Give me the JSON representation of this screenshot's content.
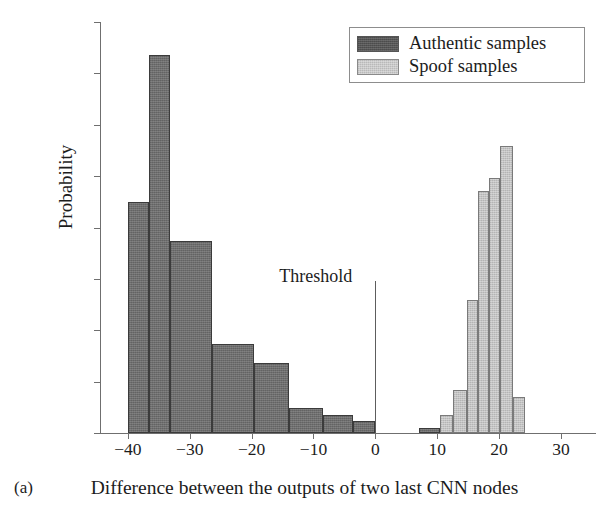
{
  "panel": {
    "tag": "(a)"
  },
  "axes": {
    "ylabel": "Probability",
    "xlabel": "Difference between the outputs of two last CNN nodes",
    "ytick_labels": [
      "0",
      "0.05",
      "0.1",
      "0.15",
      "0.2",
      "0.25",
      "0.3",
      "0.35",
      "0.4"
    ],
    "xtick_labels": [
      "−40",
      "−30",
      "−20",
      "−10",
      "0",
      "10",
      "20",
      "30"
    ]
  },
  "legend": {
    "position": "top-right",
    "entries": [
      {
        "label": "Authentic samples",
        "color": "#555555",
        "key": "authentic"
      },
      {
        "label": "Spoof samples",
        "color": "#c9c9c9",
        "key": "spoof"
      }
    ]
  },
  "annotations": [
    {
      "name": "threshold",
      "label": "Threshold",
      "x": 0,
      "y_top": 0.148,
      "line_color": "#5d5d5d"
    }
  ],
  "chart_data": {
    "type": "bar",
    "title": "",
    "subtitle": "",
    "xlabel": "Difference between the outputs of two last CNN nodes",
    "ylabel": "Probability",
    "xlim": [
      -44.5,
      35.5
    ],
    "ylim": [
      0,
      0.4
    ],
    "ytick_values": [
      0,
      0.05,
      0.1,
      0.15,
      0.2,
      0.25,
      0.3,
      0.35,
      0.4
    ],
    "xtick_values": [
      -40,
      -30,
      -20,
      -10,
      0,
      10,
      20,
      30
    ],
    "grid": false,
    "orientation": "vertical",
    "histogram": true,
    "series": [
      {
        "name": "Authentic samples",
        "key": "authentic",
        "color": "#6e6e6e",
        "bins": [
          {
            "x0": -40.0,
            "x1": -36.6,
            "value": 0.225
          },
          {
            "x0": -36.6,
            "x1": -33.2,
            "value": 0.368
          },
          {
            "x0": -33.2,
            "x1": -26.4,
            "value": 0.187
          },
          {
            "x0": -26.4,
            "x1": -19.6,
            "value": 0.087
          },
          {
            "x0": -19.6,
            "x1": -14.0,
            "value": 0.068
          },
          {
            "x0": -14.0,
            "x1": -8.4,
            "value": 0.024
          },
          {
            "x0": -8.4,
            "x1": -3.6,
            "value": 0.018
          },
          {
            "x0": -3.6,
            "x1": 0.0,
            "value": 0.012
          },
          {
            "x0": 7.0,
            "x1": 10.4,
            "value": 0.005
          }
        ]
      },
      {
        "name": "Spoof samples",
        "key": "spoof",
        "color": "#c3c3c3",
        "bins": [
          {
            "x0": 10.4,
            "x1": 12.6,
            "value": 0.018
          },
          {
            "x0": 12.6,
            "x1": 14.8,
            "value": 0.042
          },
          {
            "x0": 14.8,
            "x1": 16.6,
            "value": 0.129
          },
          {
            "x0": 16.6,
            "x1": 18.4,
            "value": 0.236
          },
          {
            "x0": 18.4,
            "x1": 20.2,
            "value": 0.248
          },
          {
            "x0": 20.2,
            "x1": 22.2,
            "value": 0.279
          },
          {
            "x0": 22.2,
            "x1": 24.2,
            "value": 0.035
          }
        ]
      }
    ]
  }
}
